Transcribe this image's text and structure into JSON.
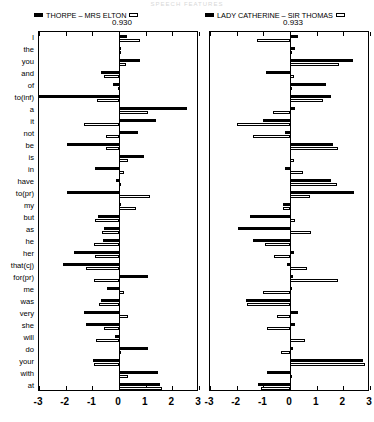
{
  "title": "SPEECH FEATURES",
  "legend": {
    "left": {
      "solid_swatch": "solid-square-marker",
      "open_swatch": "open-square-marker",
      "label": "THORPE – MRS ELTON",
      "score": "0.930"
    },
    "right": {
      "solid_swatch": "solid-square-marker",
      "open_swatch": "open-square-marker",
      "label": "LADY CATHERINE – SIR THOMAS",
      "score": "0.933"
    }
  },
  "chart_data": {
    "type": "bar",
    "orientation": "horizontal",
    "title": "SPEECH FEATURES",
    "xlabel": "",
    "ylabel": "",
    "xlim": [
      -3,
      3
    ],
    "xticks": [
      -3,
      -2,
      -1,
      0,
      1,
      2,
      3
    ],
    "xticklabels": [
      "-3",
      "-2",
      "-1",
      "0",
      "1",
      "2",
      "3"
    ],
    "grid": false,
    "legend_position": "top",
    "categories": [
      "I",
      "the",
      "you",
      "and",
      "of",
      "to(inf)",
      "a",
      "it",
      "not",
      "be",
      "is",
      "in",
      "have",
      "to(pr)",
      "my",
      "but",
      "as",
      "he",
      "her",
      "that(cj)",
      "for(pr)",
      "me",
      "was",
      "very",
      "she",
      "will",
      "do",
      "your",
      "with",
      "at"
    ],
    "panels": [
      {
        "name": "THORPE – MRS ELTON",
        "score": "0.930",
        "series": [
          {
            "name": "THORPE",
            "style": "solid",
            "values": [
              0.3,
              0.07,
              0.8,
              -0.68,
              -0.22,
              -3.05,
              2.55,
              1.4,
              0.7,
              -1.95,
              0.95,
              -0.9,
              -0.1,
              -1.95,
              0.07,
              -0.8,
              -0.58,
              -0.6,
              -1.7,
              -2.1,
              1.1,
              -0.45,
              -0.68,
              -1.3,
              -1.25,
              -0.15,
              1.1,
              -0.98,
              1.48,
              1.55
            ]
          },
          {
            "name": "MRS ELTON",
            "style": "open",
            "values": [
              0.8,
              0.02,
              0.25,
              -0.55,
              -0.05,
              -0.82,
              1.1,
              -1.3,
              -0.5,
              -0.48,
              0.32,
              0.2,
              0.0,
              1.15,
              0.65,
              -0.9,
              -0.62,
              -0.95,
              -0.9,
              -1.25,
              -0.95,
              0.2,
              -0.75,
              0.35,
              -0.58,
              -0.88,
              0.05,
              -0.92,
              0.35,
              1.6
            ]
          }
        ]
      },
      {
        "name": "LADY CATHERINE – SIR THOMAS",
        "score": "0.933",
        "series": [
          {
            "name": "LADY CATHERINE",
            "style": "solid",
            "values": [
              0.3,
              0.18,
              2.35,
              -0.9,
              1.35,
              1.55,
              0.2,
              -1.0,
              -0.2,
              1.6,
              0.05,
              -0.18,
              1.55,
              2.4,
              -0.25,
              -1.5,
              -1.95,
              -1.4,
              0.15,
              -0.1,
              0.1,
              0.08,
              -1.65,
              0.3,
              0.2,
              0.05,
              0.1,
              2.75,
              -0.88,
              -1.2
            ]
          },
          {
            "name": "SIR THOMAS",
            "style": "open",
            "values": [
              -1.22,
              0.0,
              1.85,
              0.15,
              0.05,
              1.25,
              -0.65,
              -2.0,
              -1.4,
              1.8,
              0.15,
              0.5,
              1.75,
              0.75,
              -0.28,
              0.18,
              0.8,
              -0.95,
              -0.6,
              0.65,
              1.8,
              -1.0,
              -1.6,
              -0.5,
              -0.85,
              0.55,
              -0.35,
              2.8,
              0.02,
              -1.1
            ]
          }
        ]
      }
    ]
  }
}
